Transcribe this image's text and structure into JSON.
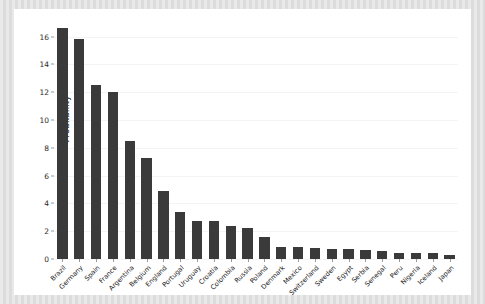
{
  "chart_data": {
    "type": "bar",
    "title": "",
    "xlabel": "",
    "ylabel": "Probability",
    "ylim": [
      0,
      17.2
    ],
    "yticks": [
      0,
      2,
      4,
      6,
      8,
      10,
      12,
      14,
      16
    ],
    "ytick_labels": [
      "0",
      "2",
      "4",
      "6",
      "8",
      "10",
      "12",
      "14",
      "16"
    ],
    "grid": true,
    "grid_axis": "y",
    "legend": null,
    "bar_color": "#3a3a3a",
    "background_color": "#ffffff",
    "figure_background_color": "#e4e4e4",
    "categories": [
      "Brazil",
      "Germany",
      "Spain",
      "France",
      "Argentina",
      "Belgium",
      "England",
      "Portugal",
      "Uruguay",
      "Croatia",
      "Colombia",
      "Russia",
      "Poland",
      "Denmark",
      "Mexico",
      "Switzerland",
      "Sweden",
      "Egypt",
      "Serbia",
      "Senegal",
      "Peru",
      "Nigeria",
      "Iceland",
      "Japan"
    ],
    "values": [
      16.6,
      15.8,
      12.5,
      12.0,
      8.5,
      7.3,
      4.9,
      3.4,
      2.7,
      2.7,
      2.4,
      2.2,
      1.6,
      0.9,
      0.85,
      0.8,
      0.75,
      0.7,
      0.65,
      0.6,
      0.45,
      0.4,
      0.4,
      0.3
    ]
  }
}
